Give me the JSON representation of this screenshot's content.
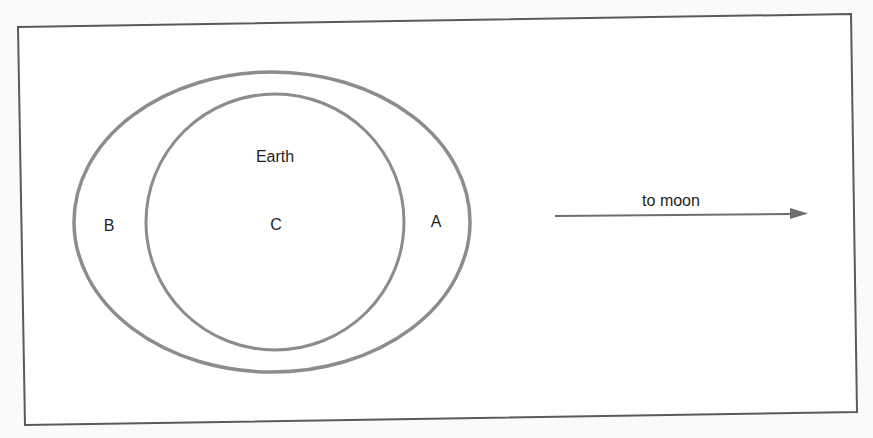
{
  "diagram": {
    "frame": {
      "stroke": "#555555"
    },
    "outer_ellipse": {
      "cx": 272,
      "cy": 222,
      "rx": 198,
      "ry": 150,
      "stroke": "#8c8c8c",
      "label": "A",
      "label_left": "B"
    },
    "inner_ellipse": {
      "cx": 275,
      "cy": 222,
      "rx": 129,
      "ry": 128,
      "stroke": "#8c8c8c"
    },
    "labels": {
      "earth": "Earth",
      "center": "C",
      "right_bulge": "A",
      "left_bulge": "B",
      "arrow": "to moon"
    },
    "arrow": {
      "x1": 555,
      "y1": 216,
      "x2": 808,
      "y2": 213,
      "color": "#6e6e6e"
    }
  }
}
